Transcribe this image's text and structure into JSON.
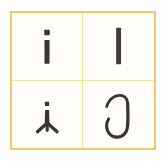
{
  "figure": {
    "kind": "letterform-specimen-grid",
    "rows": 2,
    "columns": 2,
    "frame_color": "#edca63",
    "divider_color": "#f6e29b",
    "cell_background": "#fefdfa",
    "ink_color": "#3b342c",
    "page_background": "#ffffff"
  },
  "cells": [
    {
      "position": "top-left",
      "glyph": "i",
      "glyph_name": "dotted-i",
      "description": "Sans-serif lowercase i: square dot above a plain vertical stem",
      "has_dot": "yes",
      "has_descender": "no",
      "style": "sans-serif"
    },
    {
      "position": "top-right",
      "glyph": "ı",
      "glyph_name": "dotless-i",
      "description": "Plain vertical bar with no dot, slightly taller stem",
      "has_dot": "no",
      "has_descender": "no",
      "style": "sans-serif"
    },
    {
      "position": "bottom-left",
      "glyph": "i",
      "glyph_name": "dotted-i-with-forked-foot",
      "description": "Dotted stem resting on a wide splayed Y-shaped tripod foot serif",
      "has_dot": "yes",
      "has_descender": "no",
      "style": "serif-forked-foot"
    },
    {
      "position": "bottom-right",
      "glyph": "ȷ",
      "glyph_name": "cursive-j-hook",
      "description": "Calligraphic dotless j: curved entry stroke at top descending into a deep U-shaped hook",
      "has_dot": "no",
      "has_descender": "yes",
      "style": "cursive-calligraphic"
    }
  ],
  "caption": ""
}
